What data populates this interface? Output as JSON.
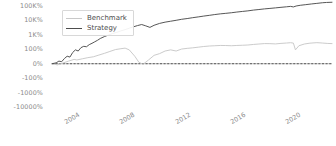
{
  "chart_data": {
    "type": "line",
    "title": "",
    "xlabel": "",
    "ylabel": "",
    "yscale": "symlog",
    "grid": false,
    "legend_position": "top-left",
    "zero_line": true,
    "y_ticks": [
      "100K%",
      "10K%",
      "1K%",
      "100%",
      "0%",
      "-100%",
      "-1000%",
      "-10000%"
    ],
    "y_tick_values": [
      100000,
      10000,
      1000,
      100,
      0,
      -100,
      -1000,
      -10000
    ],
    "x_ticks": [
      "2004",
      "2008",
      "2012",
      "2016",
      "2020"
    ],
    "x_tick_values": [
      2004,
      2008,
      2012,
      2016,
      2020
    ],
    "xlim": [
      2002.6,
      2022.9
    ],
    "series": [
      {
        "name": "Benchmark",
        "color": "#c8c8c8",
        "x": [
          2002.6,
          2003.0,
          2003.4,
          2003.8,
          2004.2,
          2004.4,
          2004.8,
          2005.2,
          2005.6,
          2006.0,
          2006.4,
          2006.8,
          2007.2,
          2007.6,
          2007.9,
          2008.2,
          2008.6,
          2008.9,
          2009.2,
          2009.6,
          2010.0,
          2010.4,
          2010.8,
          2011.2,
          2011.6,
          2012.0,
          2012.4,
          2012.8,
          2013.2,
          2013.6,
          2014.0,
          2014.4,
          2014.8,
          2015.2,
          2015.6,
          2016.0,
          2016.4,
          2016.8,
          2017.2,
          2017.6,
          2018.0,
          2018.4,
          2018.8,
          2019.2,
          2019.6,
          2019.9,
          2020.1,
          2020.25,
          2020.5,
          2020.9,
          2021.3,
          2021.8,
          2022.2,
          2022.6,
          2022.9
        ],
        "values": [
          0,
          -8,
          5,
          18,
          30,
          26,
          34,
          42,
          48,
          60,
          72,
          85,
          98,
          110,
          120,
          96,
          52,
          10,
          -4,
          26,
          58,
          70,
          88,
          96,
          88,
          104,
          116,
          126,
          140,
          156,
          168,
          176,
          184,
          182,
          176,
          184,
          190,
          198,
          216,
          232,
          248,
          246,
          236,
          256,
          272,
          286,
          268,
          96,
          176,
          232,
          266,
          288,
          272,
          254,
          248
        ]
      },
      {
        "name": "Strategy",
        "color": "#4d4d4d",
        "x": [
          2002.6,
          2002.9,
          2003.1,
          2003.3,
          2003.5,
          2003.7,
          2003.9,
          2004.1,
          2004.3,
          2004.5,
          2004.7,
          2004.9,
          2005.1,
          2005.3,
          2005.5,
          2005.7,
          2005.9,
          2006.1,
          2006.4,
          2006.7,
          2007.0,
          2007.3,
          2007.6,
          2007.9,
          2008.2,
          2008.5,
          2008.8,
          2009.1,
          2009.4,
          2009.7,
          2010.0,
          2010.4,
          2010.8,
          2011.2,
          2011.6,
          2012.0,
          2012.4,
          2012.8,
          2013.2,
          2013.6,
          2014.0,
          2014.4,
          2014.8,
          2015.2,
          2015.6,
          2016.0,
          2016.4,
          2016.8,
          2017.2,
          2017.6,
          2018.0,
          2018.4,
          2018.8,
          2019.2,
          2019.6,
          2019.9,
          2020.1,
          2020.3,
          2020.6,
          2021.0,
          2021.4,
          2021.8,
          2022.2,
          2022.5,
          2022.9
        ],
        "values": [
          0,
          6,
          18,
          14,
          36,
          52,
          46,
          78,
          96,
          88,
          130,
          160,
          150,
          210,
          260,
          330,
          420,
          560,
          760,
          980,
          1250,
          1500,
          1900,
          2300,
          2900,
          3600,
          4400,
          5200,
          4200,
          3300,
          4600,
          6200,
          7600,
          8800,
          10200,
          12000,
          13500,
          15500,
          17500,
          20000,
          22500,
          25500,
          28500,
          31000,
          34000,
          38000,
          42000,
          46000,
          52000,
          57000,
          63000,
          68000,
          74000,
          81000,
          88000,
          94000,
          86000,
          100000,
          112000,
          124000,
          138000,
          152000,
          168000,
          176000,
          182000
        ]
      }
    ]
  },
  "legend": {
    "entries": [
      {
        "label": "Benchmark",
        "color": "#c8c8c8"
      },
      {
        "label": "Strategy",
        "color": "#4d4d4d"
      }
    ]
  },
  "axis": {
    "zero_line_color": "#4d4d4d",
    "tick_color": "#8a8a8a",
    "axis_line_color": "#b0b0b0"
  }
}
